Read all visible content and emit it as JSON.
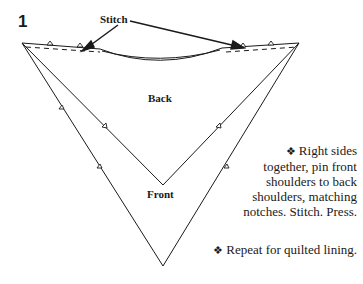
{
  "step": {
    "number": "1"
  },
  "labels": {
    "stitch": "Stitch",
    "back": "Back",
    "front": "Front"
  },
  "instructions": [
    {
      "bullet": "❖",
      "lines": [
        "Right sides",
        "together, pin front",
        "shoulders to back",
        "shoulders, matching",
        "notches. Stitch. Press."
      ]
    },
    {
      "bullet": "❖",
      "lines": [
        "Repeat for quilted lining."
      ]
    }
  ],
  "colors": {
    "line": "#1a1a1a",
    "background": "#ffffff"
  }
}
